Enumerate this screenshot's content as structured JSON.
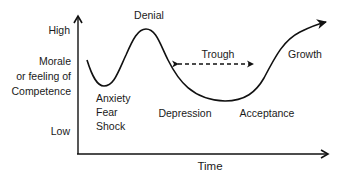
{
  "diagram": {
    "type": "change-curve",
    "y_axis": {
      "high_label": "High",
      "title_lines": [
        "Morale",
        "or feeling of",
        "Competence"
      ],
      "low_label": "Low"
    },
    "x_axis": {
      "label": "Time"
    },
    "stages": {
      "anxiety_lines": [
        "Anxiety",
        "Fear",
        "Shock"
      ],
      "denial": "Denial",
      "depression": "Depression",
      "trough": "Trough",
      "acceptance": "Acceptance",
      "growth": "Growth"
    },
    "colors": {
      "line": "#111111",
      "text": "#1a1a1a",
      "background": "#ffffff"
    }
  }
}
